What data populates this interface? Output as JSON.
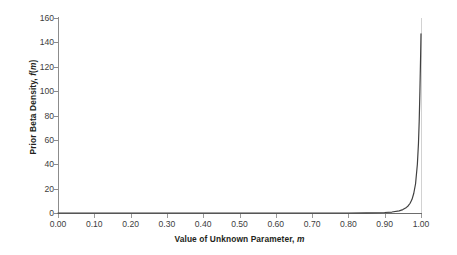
{
  "chart_data": {
    "type": "line",
    "title": "",
    "xlabel": "Value of Unknown Parameter, m",
    "ylabel": "Prior Beta Density, f(m)",
    "xlabel_text": "Value of Unknown Parameter,",
    "xlabel_italic": "m",
    "ylabel_text": "Prior Beta Density,",
    "ylabel_italic_f": "f",
    "ylabel_paren_open": "(",
    "ylabel_italic_m": "m",
    "ylabel_paren_close": ")",
    "xlim": [
      0.0,
      1.0
    ],
    "ylim": [
      0,
      160
    ],
    "grid": "horizontal",
    "legend": "none",
    "line_color": "#404040",
    "grid_color": "#7f7f7f",
    "axis_color": "#8c8c8c",
    "background_color": "#ffffff",
    "xticks": [
      "0.00",
      "0.10",
      "0.20",
      "0.30",
      "0.40",
      "0.50",
      "0.60",
      "0.70",
      "0.80",
      "0.90",
      "1.00"
    ],
    "xtick_values": [
      0.0,
      0.1,
      0.2,
      0.3,
      0.4,
      0.5,
      0.6,
      0.7,
      0.8,
      0.9,
      1.0
    ],
    "yticks": [
      "0",
      "20",
      "40",
      "60",
      "80",
      "100",
      "120",
      "140",
      "160"
    ],
    "ytick_values": [
      0,
      20,
      40,
      60,
      80,
      100,
      120,
      140,
      160
    ],
    "series": [
      {
        "name": "Prior Beta Density",
        "x": [
          0.0,
          0.05,
          0.1,
          0.15,
          0.2,
          0.25,
          0.3,
          0.35,
          0.4,
          0.45,
          0.5,
          0.55,
          0.6,
          0.65,
          0.7,
          0.75,
          0.8,
          0.85,
          0.88,
          0.9,
          0.92,
          0.94,
          0.95,
          0.96,
          0.965,
          0.97,
          0.975,
          0.98,
          0.985,
          0.99,
          0.993,
          0.995,
          0.997,
          0.999,
          1.0
        ],
        "values": [
          0.0,
          0.0,
          0.0,
          0.0,
          0.0,
          0.0,
          0.0,
          0.0,
          0.0,
          0.0,
          0.0,
          0.0,
          0.0,
          0.0,
          0.0,
          0.0,
          0.0,
          0.1,
          0.2,
          0.4,
          0.8,
          1.8,
          2.8,
          4.6,
          6.0,
          8.0,
          11.0,
          16.0,
          24.0,
          40.0,
          57.0,
          75.0,
          100.0,
          130.0,
          147.0
        ]
      }
    ]
  }
}
